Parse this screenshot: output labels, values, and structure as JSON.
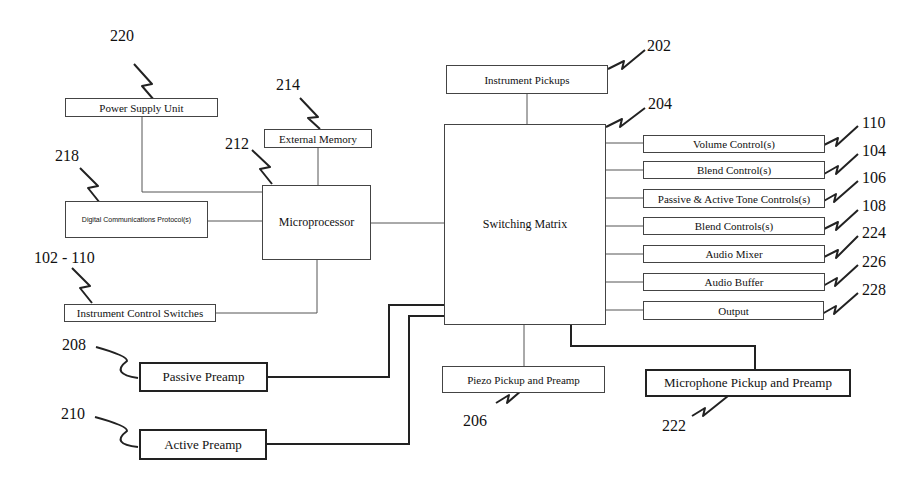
{
  "diagram": {
    "type": "block-diagram",
    "blocks": {
      "power_supply": {
        "label": "Power Supply Unit",
        "ref": "220"
      },
      "external_memory": {
        "label": "External Memory",
        "ref": "214"
      },
      "microprocessor": {
        "label": "Microprocessor",
        "ref": "212"
      },
      "digital_comm": {
        "label": "Digital Communications Protocol(s)",
        "ref": "218"
      },
      "control_switches": {
        "label": "Instrument Control Switches",
        "ref": "102 - 110"
      },
      "instrument_pickups": {
        "label": "Instrument Pickups",
        "ref": "202"
      },
      "switching_matrix": {
        "label": "Switching Matrix",
        "ref": "204"
      },
      "passive_preamp": {
        "label": "Passive Preamp",
        "ref": "208"
      },
      "active_preamp": {
        "label": "Active Preamp",
        "ref": "210"
      },
      "piezo": {
        "label": "Piezo Pickup and Preamp",
        "ref": "206"
      },
      "microphone": {
        "label": "Microphone Pickup and Preamp",
        "ref": "222"
      }
    },
    "outputs": [
      {
        "label": "Volume Control(s)",
        "ref": "110"
      },
      {
        "label": "Blend Control(s)",
        "ref": "104"
      },
      {
        "label": "Passive & Active Tone Controls(s)",
        "ref": "106"
      },
      {
        "label": "Blend Controls(s)",
        "ref": "108"
      },
      {
        "label": "Audio Mixer",
        "ref": "224"
      },
      {
        "label": "Audio Buffer",
        "ref": "226"
      },
      {
        "label": "Output",
        "ref": "228"
      }
    ],
    "connections": [
      [
        "Power Supply Unit",
        "Microprocessor"
      ],
      [
        "External Memory",
        "Microprocessor"
      ],
      [
        "Digital Communications Protocol(s)",
        "Microprocessor"
      ],
      [
        "Instrument Control Switches",
        "Microprocessor"
      ],
      [
        "Microprocessor",
        "Switching Matrix"
      ],
      [
        "Instrument Pickups",
        "Switching Matrix"
      ],
      [
        "Passive Preamp",
        "Switching Matrix"
      ],
      [
        "Active Preamp",
        "Switching Matrix"
      ],
      [
        "Piezo Pickup and Preamp",
        "Switching Matrix"
      ],
      [
        "Microphone Pickup and Preamp",
        "Switching Matrix"
      ],
      [
        "Switching Matrix",
        "Volume Control(s)"
      ],
      [
        "Switching Matrix",
        "Blend Control(s)"
      ],
      [
        "Switching Matrix",
        "Passive & Active Tone Controls(s)"
      ],
      [
        "Switching Matrix",
        "Blend Controls(s)"
      ],
      [
        "Switching Matrix",
        "Audio Mixer"
      ],
      [
        "Switching Matrix",
        "Audio Buffer"
      ],
      [
        "Switching Matrix",
        "Output"
      ]
    ]
  }
}
